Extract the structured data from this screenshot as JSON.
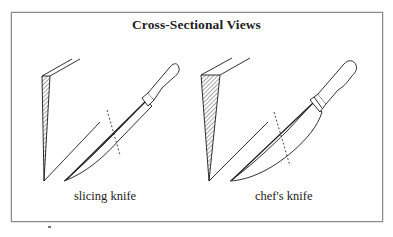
{
  "figure": {
    "title": "Cross-Sectional Views",
    "panels": [
      {
        "label": "slicing knife",
        "cross_section": "thin narrow wedge",
        "blade": "long narrow blade"
      },
      {
        "label": "chef's knife",
        "cross_section": "wide wedge",
        "blade": "broad curved blade"
      }
    ],
    "colors": {
      "line": "#1a1a1a",
      "border": "#8a8a8a",
      "background": "#ffffff"
    }
  }
}
